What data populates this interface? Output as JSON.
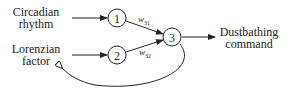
{
  "diagram": {
    "inputs": [
      {
        "line1": "Circadian",
        "line2": "rhythm"
      },
      {
        "line1": "Lorenzian",
        "line2": "factor"
      }
    ],
    "output": {
      "line1": "Dustbathing",
      "line2": "command"
    },
    "nodes": [
      "1",
      "2",
      "3"
    ],
    "weights": [
      {
        "base": "w",
        "sub": "31"
      },
      {
        "base": "w",
        "sub": "32"
      }
    ]
  }
}
